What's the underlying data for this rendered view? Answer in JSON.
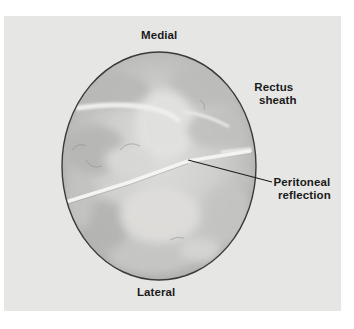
{
  "figure": {
    "view": "endoscopic circular field of view",
    "colors": {
      "page_background": "#ffffff",
      "panel_background": "#e6e6e4",
      "field_fill": "#c9c9c7",
      "field_border": "#3a3a3a",
      "fold_highlight": "#f2f2f0",
      "pointer_line": "#1e1e1e",
      "label_text": "#1a1a1a"
    },
    "labels": {
      "medial": "Medial",
      "lateral": "Lateral",
      "rectus_sheath": {
        "line1": "Rectus",
        "line2": "sheath"
      },
      "peritoneal_reflection": {
        "line1": "Peritoneal",
        "line2": "reflection"
      }
    },
    "orientation": {
      "top": "Medial",
      "bottom": "Lateral"
    }
  }
}
